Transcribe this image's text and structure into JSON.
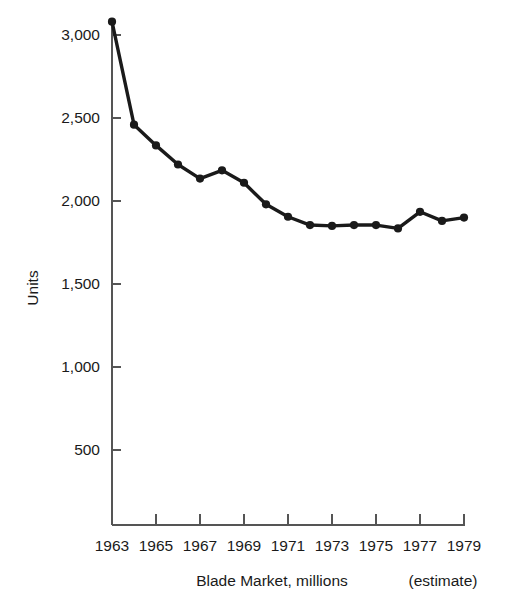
{
  "chart_data": {
    "type": "line",
    "title": "",
    "xlabel": "Blade Market, millions",
    "ylabel": "Units",
    "annotation": "(estimate)",
    "x": [
      1963,
      1964,
      1965,
      1966,
      1967,
      1968,
      1969,
      1970,
      1971,
      1972,
      1973,
      1974,
      1975,
      1976,
      1977,
      1978,
      1979
    ],
    "values": [
      3080,
      2460,
      2335,
      2220,
      2135,
      2185,
      2110,
      1980,
      1905,
      1855,
      1850,
      1855,
      1855,
      1835,
      1935,
      1880,
      1900
    ],
    "series": [
      {
        "name": "Blade Market",
        "values": [
          3080,
          2460,
          2335,
          2220,
          2135,
          2185,
          2110,
          1980,
          1905,
          1855,
          1850,
          1855,
          1855,
          1835,
          1935,
          1880,
          1900
        ]
      }
    ],
    "xtick_values": [
      1963,
      1965,
      1967,
      1969,
      1971,
      1973,
      1975,
      1977,
      1979
    ],
    "xtick_labels": [
      "1963",
      "1965",
      "1967",
      "1969",
      "1971",
      "1973",
      "1975",
      "1977",
      "1979"
    ],
    "ytick_values": [
      500,
      1000,
      1500,
      2000,
      2500,
      3000
    ],
    "ytick_labels": [
      "500",
      "1,000",
      "1,500",
      "2,000",
      "2,500",
      "3,000"
    ],
    "xlim": [
      1963,
      1979
    ],
    "ylim": [
      50,
      3140
    ],
    "grid": false,
    "legend": false,
    "marker": "circle",
    "line_color": "#1a1a1a",
    "axis_color": "#555555",
    "background_color": "#ffffff"
  }
}
